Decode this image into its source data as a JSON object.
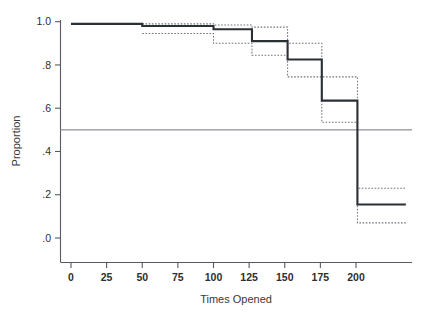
{
  "chart_data": {
    "type": "line",
    "title": "",
    "xlabel": "Times Opened",
    "ylabel": "Proportion",
    "xlim": [
      0,
      235
    ],
    "ylim": [
      0.0,
      1.0
    ],
    "xticks": [
      0,
      25,
      50,
      75,
      100,
      125,
      150,
      175,
      200
    ],
    "xtick_labels": [
      "0",
      "25",
      "50",
      "75",
      "100",
      "125",
      "150",
      "175",
      "200"
    ],
    "yticks": [
      0.0,
      0.2,
      0.4,
      0.6,
      0.8,
      1.0
    ],
    "ytick_labels": [
      ".0",
      ".2",
      ".4",
      ".6",
      ".8",
      "1.0"
    ],
    "grid": false,
    "legend": "none",
    "reference_line": {
      "y": 0.5,
      "color": "#8d9197",
      "label": ""
    },
    "series": [
      {
        "name": "Survival estimate",
        "style": "solid-step",
        "color": "#2b2f36",
        "steps": [
          {
            "x_start": 0,
            "x_end": 50,
            "y": 0.99
          },
          {
            "x_start": 50,
            "x_end": 100,
            "y": 0.98
          },
          {
            "x_start": 100,
            "x_end": 127,
            "y": 0.965
          },
          {
            "x_start": 127,
            "x_end": 152,
            "y": 0.91
          },
          {
            "x_start": 152,
            "x_end": 176,
            "y": 0.825
          },
          {
            "x_start": 176,
            "x_end": 201,
            "y": 0.635
          },
          {
            "x_start": 201,
            "x_end": 235,
            "y": 0.155
          }
        ]
      },
      {
        "name": "Upper confidence limit",
        "style": "dotted-step",
        "color": "#6e737c",
        "steps": [
          {
            "x_start": 50,
            "x_end": 100,
            "y": 0.99
          },
          {
            "x_start": 100,
            "x_end": 127,
            "y": 0.985
          },
          {
            "x_start": 127,
            "x_end": 152,
            "y": 0.975
          },
          {
            "x_start": 152,
            "x_end": 176,
            "y": 0.9
          },
          {
            "x_start": 176,
            "x_end": 201,
            "y": 0.745
          },
          {
            "x_start": 201,
            "x_end": 235,
            "y": 0.23
          }
        ]
      },
      {
        "name": "Lower confidence limit",
        "style": "dotted-step",
        "color": "#6e737c",
        "steps": [
          {
            "x_start": 50,
            "x_end": 100,
            "y": 0.945
          },
          {
            "x_start": 100,
            "x_end": 127,
            "y": 0.9
          },
          {
            "x_start": 127,
            "x_end": 152,
            "y": 0.845
          },
          {
            "x_start": 152,
            "x_end": 176,
            "y": 0.745
          },
          {
            "x_start": 176,
            "x_end": 201,
            "y": 0.535
          },
          {
            "x_start": 201,
            "x_end": 235,
            "y": 0.07
          }
        ]
      }
    ]
  }
}
